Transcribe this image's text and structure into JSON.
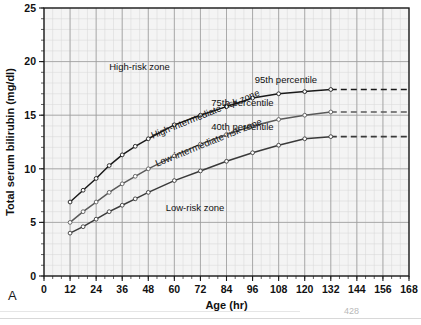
{
  "figure": {
    "panel_label": "A",
    "page_number": "428"
  },
  "chart_data": {
    "type": "line",
    "title": "",
    "xlabel": "Age (hr)",
    "ylabel": "Total serum bilirubin (mg/dl)",
    "xlim": [
      0,
      168
    ],
    "ylim": [
      0,
      25
    ],
    "xticks": [
      0,
      12,
      24,
      36,
      48,
      60,
      72,
      84,
      96,
      108,
      120,
      132,
      144,
      156,
      168
    ],
    "yticks": [
      0,
      5,
      10,
      15,
      20,
      25
    ],
    "x_minor_step": 4,
    "y_minor_step": 1,
    "grid": true,
    "legend_position": "inline-annotations",
    "series": [
      {
        "name": "95th percentile",
        "label": "95th percentile",
        "color": "#1a1a1a",
        "x": [
          12,
          18,
          24,
          30,
          36,
          42,
          48,
          60,
          72,
          84,
          96,
          108,
          120,
          132
        ],
        "y": [
          6.9,
          8.0,
          9.1,
          10.3,
          11.3,
          12.1,
          12.8,
          14.1,
          15.0,
          15.8,
          16.6,
          17.0,
          17.2,
          17.4
        ],
        "dashed_extension": {
          "x": [
            132,
            168
          ],
          "y": [
            17.4,
            17.4
          ]
        }
      },
      {
        "name": "75th percentile",
        "label": "75th percentile",
        "color": "#5a5a5a",
        "x": [
          12,
          18,
          24,
          30,
          36,
          42,
          48,
          60,
          72,
          84,
          96,
          108,
          120,
          132
        ],
        "y": [
          5.0,
          6.0,
          6.9,
          7.8,
          8.6,
          9.3,
          10.0,
          11.2,
          12.3,
          13.2,
          14.0,
          14.6,
          15.0,
          15.3
        ],
        "dashed_extension": {
          "x": [
            132,
            168
          ],
          "y": [
            15.3,
            15.3
          ]
        }
      },
      {
        "name": "40th percentile",
        "label": "40th percentile",
        "color": "#3a3a3a",
        "x": [
          12,
          18,
          24,
          30,
          36,
          42,
          48,
          60,
          72,
          84,
          96,
          108,
          120,
          132
        ],
        "y": [
          4.0,
          4.6,
          5.3,
          6.0,
          6.6,
          7.2,
          7.8,
          8.9,
          9.8,
          10.7,
          11.5,
          12.2,
          12.8,
          13.0
        ],
        "dashed_extension": {
          "x": [
            132,
            168
          ],
          "y": [
            13.0,
            13.0
          ]
        }
      }
    ],
    "annotations": [
      {
        "name": "high-risk-zone-label",
        "text": "High-risk zone",
        "x": 30,
        "y": 19.2,
        "rotation": 0,
        "anchor": "start"
      },
      {
        "name": "high-intermediate-risk-zone-label",
        "text": "High-intermediate-risk zone",
        "x": 50,
        "y": 12.8,
        "rotation": -22,
        "anchor": "start"
      },
      {
        "name": "low-intermediate-risk-zone-label",
        "text": "Low-intermediate-risk zone",
        "x": 52,
        "y": 10.2,
        "rotation": -22,
        "anchor": "start"
      },
      {
        "name": "low-risk-zone-label",
        "text": "Low-risk zone",
        "x": 56,
        "y": 6.1,
        "rotation": 0,
        "anchor": "start"
      },
      {
        "name": "series-label-95th",
        "text": "95th percentile",
        "x": 97,
        "y": 18.0,
        "rotation": 0,
        "anchor": "start"
      },
      {
        "name": "series-label-75th",
        "text": "75th percentile",
        "x": 77,
        "y": 15.9,
        "rotation": 0,
        "anchor": "start"
      },
      {
        "name": "series-label-40th",
        "text": "40th percentile",
        "x": 77,
        "y": 13.6,
        "rotation": 0,
        "anchor": "start"
      }
    ],
    "colors": {
      "axis": "#1a1a1a",
      "grid_major": "#9a9a9a",
      "grid_minor": "#d6d6d6",
      "plot_background": "#f4f4f4",
      "text": "#111111"
    }
  }
}
